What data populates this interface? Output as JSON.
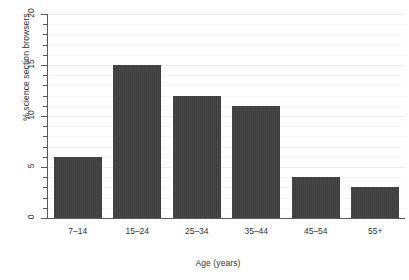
{
  "chart_data": {
    "type": "bar",
    "title": "",
    "subtitle": "",
    "xlabel": "Age (years)",
    "ylabel": "% science section browsers",
    "categories": [
      "7–14",
      "15–24",
      "25–34",
      "35–44",
      "45–54",
      "55+"
    ],
    "values": [
      6,
      15,
      12,
      11,
      4,
      3
    ],
    "ylim": [
      0,
      20
    ],
    "y_major_ticks": [
      0,
      5,
      10,
      15,
      20
    ],
    "y_major_tick_labels": [
      "0",
      "5",
      "10",
      "15",
      "20"
    ],
    "y_minor_tick_interval": 1,
    "grid": true,
    "grid_axis": "y",
    "legend": "none",
    "bar_color": "#3d3d3d",
    "gridline_color": "#f4f4f4",
    "axis_color": "#5a5a5a",
    "background_color": "#ffffff",
    "text_color": "#333333"
  }
}
